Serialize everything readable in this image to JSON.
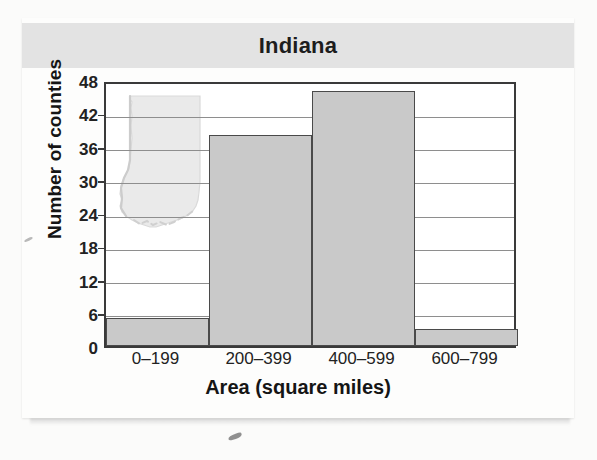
{
  "figure": {
    "title": "Indiana",
    "map_watermark_name": "indiana-state-outline"
  },
  "chart_data": {
    "type": "bar",
    "title": "Indiana",
    "xlabel": "Area (square miles)",
    "ylabel": "Number of counties",
    "categories": [
      "0–199",
      "200–399",
      "400–599",
      "600–799"
    ],
    "values": [
      5,
      38,
      46,
      3
    ],
    "ylim": [
      0,
      48
    ],
    "yticks": [
      0,
      6,
      12,
      18,
      24,
      30,
      36,
      42,
      48
    ],
    "ytick_labels": [
      "0",
      "6",
      "12",
      "18",
      "24",
      "30",
      "36",
      "42",
      "48"
    ],
    "grid": true,
    "legend": "none",
    "bar_fill": "#c9c9c9",
    "bar_edge": "#4a4a4a",
    "gridline_color": "#8e8e8e"
  },
  "colors": {
    "title_band": "#e3e3e3",
    "card_background": "#fdfdfc",
    "page_background": "#fbfbfa",
    "axis_frame": "#3a3a3a",
    "text": "#151515"
  }
}
